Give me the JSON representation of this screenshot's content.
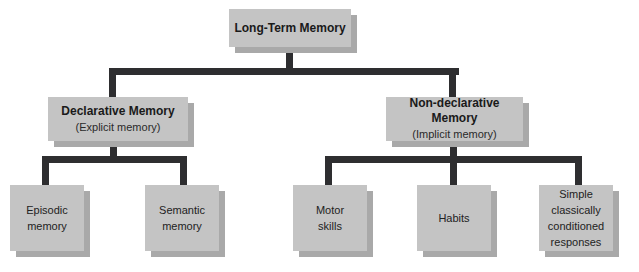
{
  "diagram": {
    "root": {
      "title": "Long-Term Memory"
    },
    "branches": [
      {
        "title": "Declarative Memory",
        "subtitle": "(Explicit memory)",
        "children": [
          {
            "label": "Episodic\nmemory",
            "lines": [
              "Episodic",
              "memory"
            ]
          },
          {
            "label": "Semantic\nmemory",
            "lines": [
              "Semantic",
              "memory"
            ]
          }
        ]
      },
      {
        "title": "Non-declarative Memory",
        "subtitle": "(Implicit memory)",
        "children": [
          {
            "label": "Motor\nskills",
            "lines": [
              "Motor",
              "skills"
            ]
          },
          {
            "label": "Habits",
            "lines": [
              "Habits"
            ]
          },
          {
            "label": "Simple\nclassically\nconditioned\nresponses",
            "lines": [
              "Simple",
              "classically",
              "conditioned",
              "responses"
            ]
          }
        ]
      }
    ],
    "colors": {
      "box_fill": "#c4c4c4",
      "box_shadow": "#a9a9a9",
      "connector": "#2e2e30",
      "background": "#ffffff"
    }
  }
}
